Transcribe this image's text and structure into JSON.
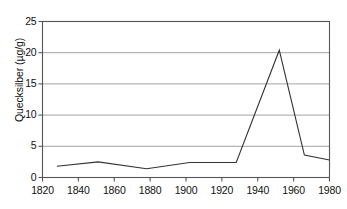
{
  "chart_data": {
    "type": "line",
    "title": "",
    "subtitle": "",
    "xlabel": "",
    "ylabel": "Quecksilber (µg/g)",
    "xlim": [
      1820,
      1980
    ],
    "ylim": [
      0,
      25
    ],
    "grid": "horizontal",
    "legend": "none",
    "xticks": [
      "1820",
      "1840",
      "1860",
      "1880",
      "1900",
      "1920",
      "1940",
      "1960",
      "1980"
    ],
    "yticks": [
      "0",
      "5",
      "10",
      "15",
      "20",
      "25"
    ],
    "xtick_values": [
      1820,
      1840,
      1860,
      1880,
      1900,
      1920,
      1940,
      1960,
      1980
    ],
    "ytick_values": [
      0,
      5,
      10,
      15,
      20,
      25
    ],
    "series": [
      {
        "name": "Quecksilber",
        "color": "#333333",
        "x": [
          1828,
          1851,
          1878,
          1902,
          1928,
          1952,
          1966,
          1980
        ],
        "values": [
          1.8,
          2.5,
          1.4,
          2.4,
          2.4,
          20.4,
          3.6,
          2.8
        ]
      }
    ]
  },
  "axes": {
    "y_title": "Quecksilber (µg/g)"
  },
  "colors": {
    "line": "#333333",
    "grid": "#999999",
    "border": "#555555",
    "text": "#111111",
    "background": "#ffffff"
  }
}
